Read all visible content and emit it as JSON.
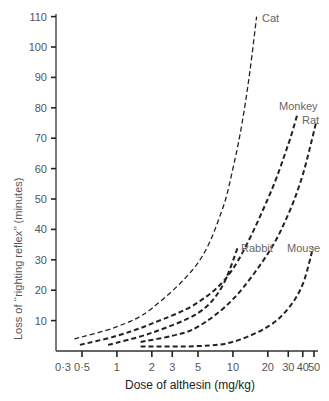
{
  "chart_data": {
    "type": "line",
    "title": "",
    "xlabel": "Dose of althesin (mg/kg)",
    "ylabel": "Loss of ‘‘righting reflex’’ (minutes)",
    "xscale": "log",
    "xlim": [
      0.3,
      50
    ],
    "ylim": [
      0,
      110
    ],
    "grid": false,
    "legend": "inline labels at curve ends",
    "x_ticks": [
      {
        "value": 0.3,
        "label": "0·3",
        "tick": false
      },
      {
        "value": 0.5,
        "label": "0·5",
        "tick": true
      },
      {
        "value": 1,
        "label": "1",
        "tick": true
      },
      {
        "value": 2,
        "label": "2",
        "tick": true
      },
      {
        "value": 3,
        "label": "3",
        "tick": true
      },
      {
        "value": 5,
        "label": "5",
        "tick": true
      },
      {
        "value": 10,
        "label": "10",
        "tick": true
      },
      {
        "value": 20,
        "label": "20",
        "tick": true
      },
      {
        "value": 30,
        "label": "30",
        "tick": true
      },
      {
        "value": 40,
        "label": "40",
        "tick": true
      },
      {
        "value": 50,
        "label": "50",
        "tick": true
      }
    ],
    "y_ticks": [
      10,
      20,
      30,
      40,
      50,
      60,
      70,
      80,
      90,
      100,
      110
    ],
    "series": [
      {
        "name": "Cat",
        "style": "fine-dash",
        "x": [
          0.43,
          1,
          2,
          5,
          8,
          10,
          12,
          14,
          16
        ],
        "y": [
          4,
          8,
          14,
          29,
          46,
          60,
          75,
          92,
          110
        ]
      },
      {
        "name": "Monkey",
        "style": "bold-dash",
        "x": [
          0.48,
          1,
          2,
          5,
          10,
          20,
          30,
          36
        ],
        "y": [
          2,
          5,
          9,
          16,
          27,
          50,
          68,
          78
        ]
      },
      {
        "name": "Rat",
        "style": "bold-dash",
        "x": [
          1.6,
          3,
          5,
          10,
          20,
          30,
          40,
          52
        ],
        "y": [
          3,
          5,
          8,
          17,
          32,
          45,
          58,
          75
        ]
      },
      {
        "name": "Rabbit",
        "style": "bold-dash",
        "x": [
          0.84,
          2,
          5,
          8,
          11
        ],
        "y": [
          2,
          6,
          12.5,
          21,
          34
        ]
      },
      {
        "name": "Mouse",
        "style": "bold-dash",
        "x": [
          1.6,
          5,
          10,
          20,
          30,
          40,
          49
        ],
        "y": [
          1.5,
          1.6,
          3,
          8,
          14,
          22,
          34
        ]
      }
    ],
    "annotations": [
      "Cat",
      "Monkey",
      "Rat",
      "Rabbit",
      "Mouse"
    ]
  },
  "labels": {
    "xlabel": "Dose of althesin (mg/kg)",
    "ylabel": "Loss of ‘‘righting reflex’’ (minutes)",
    "cat": "Cat",
    "monkey": "Monkey",
    "rat": "Rat",
    "rabbit": "Rabbit",
    "mouse": "Mouse"
  }
}
